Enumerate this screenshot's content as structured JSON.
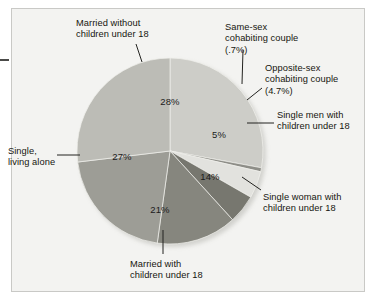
{
  "chart_data": {
    "type": "pie",
    "title": "",
    "subtitle": "",
    "xlabel": "",
    "ylabel": "",
    "legend_position": "callout-labels",
    "grid": false,
    "total": 100,
    "categories": [
      "Married without children under 18",
      "Same-sex cohabiting couple",
      "Opposite-sex cohabiting couple",
      "Single men with children under 18",
      "Single woman with children under 18",
      "Married with children under 18",
      "Single, living alone"
    ],
    "values": [
      28,
      0.7,
      4.7,
      5,
      14,
      21,
      27
    ],
    "value_labels": [
      "28%",
      "(.7%)",
      "(4.7%)",
      "5%",
      "14%",
      "21%",
      "27%"
    ],
    "colors": [
      "#cdcdc8",
      "#8e8e88",
      "#e2e2de",
      "#77776f",
      "#86867e",
      "#9d9d96",
      "#bcbcb6"
    ]
  },
  "slices": [
    {
      "label": "28%",
      "x": 170,
      "y": 101
    },
    {
      "label": "5%",
      "x": 219,
      "y": 134
    },
    {
      "label": "14%",
      "x": 210,
      "y": 176
    },
    {
      "label": "21%",
      "x": 160,
      "y": 209
    },
    {
      "label": "27%",
      "x": 122,
      "y": 156
    }
  ],
  "callouts": {
    "married_without": "Married without\nchildren under 18",
    "same_sex": "Same-sex\ncohabiting couple\n(.7%)",
    "opposite_sex": "Opposite-sex\ncohabiting couple\n(4.7%)",
    "single_men": "Single men with\nchildren under 18",
    "single_woman": "Single woman with\nchildren under 18",
    "married_with": "Married with\nchildren under 18",
    "single_alone": "Single,\nliving alone"
  }
}
